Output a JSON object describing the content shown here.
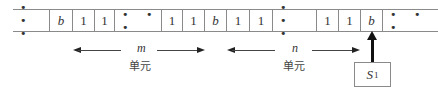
{
  "tape": {
    "cells": [
      {
        "symbol": "• • •",
        "kind": "ellipsis",
        "left": 0,
        "width": 37
      },
      {
        "symbol": "b",
        "kind": "blank",
        "left": 37,
        "width": 23
      },
      {
        "symbol": "1",
        "kind": "one",
        "left": 60,
        "width": 22
      },
      {
        "symbol": "1",
        "kind": "one",
        "left": 82,
        "width": 20
      },
      {
        "symbol": "• • •",
        "kind": "ellipsis",
        "left": 102,
        "width": 47
      },
      {
        "symbol": "1",
        "kind": "one",
        "left": 149,
        "width": 21
      },
      {
        "symbol": "1",
        "kind": "one",
        "left": 170,
        "width": 22
      },
      {
        "symbol": "b",
        "kind": "blank",
        "left": 192,
        "width": 22
      },
      {
        "symbol": "1",
        "kind": "one",
        "left": 214,
        "width": 23
      },
      {
        "symbol": "1",
        "kind": "one",
        "left": 237,
        "width": 23
      },
      {
        "symbol": "• • •",
        "kind": "ellipsis",
        "left": 260,
        "width": 44
      },
      {
        "symbol": "1",
        "kind": "one",
        "left": 304,
        "width": 22
      },
      {
        "symbol": "1",
        "kind": "one",
        "left": 326,
        "width": 22
      },
      {
        "symbol": "b",
        "kind": "blank",
        "left": 348,
        "width": 22
      },
      {
        "symbol": "• • •",
        "kind": "ellipsis",
        "left": 370,
        "width": 55
      }
    ]
  },
  "spans": [
    {
      "variable": "m",
      "unit_label": "单元"
    },
    {
      "variable": "n",
      "unit_label": "单元"
    }
  ],
  "head": {
    "state_label": "S",
    "state_subscript": "1"
  }
}
